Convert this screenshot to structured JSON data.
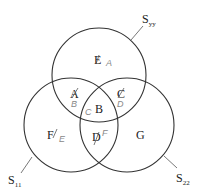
{
  "diagram": {
    "type": "three-set venn diagram",
    "sets": [
      {
        "id": "top",
        "name": "S",
        "subscript": "yy",
        "label_full": "Syy"
      },
      {
        "id": "left",
        "name": "S",
        "subscript": "11",
        "label_full": "S11"
      },
      {
        "id": "right",
        "name": "S",
        "subscript": "22",
        "label_full": "S22"
      }
    ],
    "regions": [
      {
        "id": "top-only",
        "label": "E",
        "annotation": "A",
        "struck": true
      },
      {
        "id": "top-left",
        "label": "A",
        "annotation": "B",
        "struck": true
      },
      {
        "id": "top-right",
        "label": "C",
        "annotation": "D",
        "struck": true
      },
      {
        "id": "center",
        "label": "B",
        "annotation": "C",
        "struck": false
      },
      {
        "id": "left-only",
        "label": "F",
        "annotation": "E",
        "struck": true
      },
      {
        "id": "left-right",
        "label": "D",
        "annotation": "F",
        "struck": true
      },
      {
        "id": "right-only",
        "label": "G",
        "annotation": "",
        "struck": false
      }
    ]
  }
}
